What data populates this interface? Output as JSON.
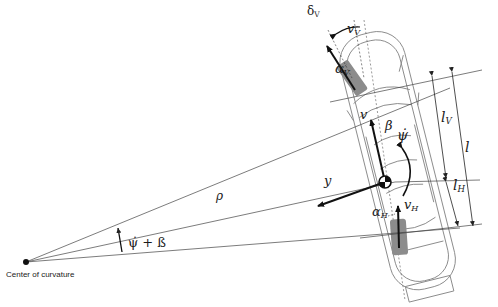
{
  "diagram": {
    "type": "single-track vehicle model (top view)",
    "colors": {
      "line": "#333333",
      "car_outline": "#7a7a7a",
      "wheel": "#8c8c8c",
      "vector": "#111111",
      "background": "#ffffff"
    },
    "caption": {
      "center_of_curvature": "Center of curvature"
    },
    "labels": {
      "delta_v": "δ",
      "delta_v_sub": "V",
      "v_v": "v",
      "v_v_sub": "V",
      "alpha_v": "α",
      "alpha_v_sub": "V",
      "v": "v",
      "beta": "β",
      "psi_dot": "ψ̇",
      "y": "y",
      "rho": "ρ",
      "v_h": "v",
      "v_h_sub": "H",
      "alpha_h": "α",
      "alpha_h_sub": "H",
      "l_v": "l",
      "l_v_sub": "V",
      "l": "l",
      "l_h": "l",
      "l_h_sub": "H",
      "psi_beta": "ψ̇ + ß"
    }
  }
}
